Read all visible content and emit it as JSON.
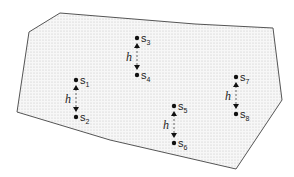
{
  "diagram": {
    "region": {
      "points": [
        [
          60,
          13
        ],
        [
          29,
          32
        ],
        [
          17,
          112
        ],
        [
          110,
          140
        ],
        [
          236,
          169
        ],
        [
          282,
          100
        ],
        [
          273,
          28
        ],
        [
          195,
          24
        ]
      ],
      "fill": "#f4f4f4",
      "stroke": "#555555",
      "pattern": "dotted"
    },
    "pairs": [
      {
        "top": {
          "name": "s",
          "sub": "1",
          "x": 76,
          "y": 80
        },
        "bottom": {
          "name": "s",
          "sub": "2",
          "x": 76,
          "y": 117
        },
        "h_label": "h"
      },
      {
        "top": {
          "name": "s",
          "sub": "3",
          "x": 137,
          "y": 38
        },
        "bottom": {
          "name": "s",
          "sub": "4",
          "x": 137,
          "y": 75
        },
        "h_label": "h"
      },
      {
        "top": {
          "name": "s",
          "sub": "5",
          "x": 174,
          "y": 106
        },
        "bottom": {
          "name": "s",
          "sub": "6",
          "x": 174,
          "y": 143
        },
        "h_label": "h"
      },
      {
        "top": {
          "name": "s",
          "sub": "7",
          "x": 236,
          "y": 77
        },
        "bottom": {
          "name": "s",
          "sub": "8",
          "x": 236,
          "y": 114
        },
        "h_label": "h"
      }
    ]
  }
}
